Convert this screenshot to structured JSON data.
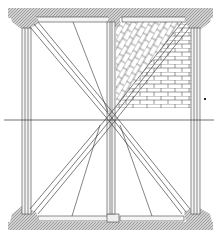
{
  "figure": {
    "colors": {
      "background": "#ffffff",
      "line": "#333333",
      "hatch_fill": "#b8b8b8",
      "member_fill": "#f4f4f4"
    },
    "elements": {
      "top_plate": "top-beam",
      "bottom_sill": "bottom-beam",
      "left_post": "left-post",
      "center_post": "center-post",
      "right_post": "right-post",
      "diagonal_braces": "x-braces",
      "brick_infill": "brick-infill",
      "herringbone_infill": "diagonal-brick-infill",
      "horizontal_axis": "center-line"
    }
  }
}
